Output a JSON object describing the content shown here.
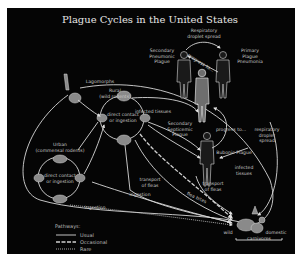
{
  "title": "Plague Cycles in the United States",
  "labels": {
    "respiratory_droplet_top": [
      "Respiratory",
      "droplet spread"
    ],
    "secondary_pneumonic": [
      "Secondary",
      "Pneumonic",
      "Plague"
    ],
    "primary_pneumonia": [
      "Primary",
      "Plague",
      "Pneumonia"
    ],
    "progress_to_top": "progress to...",
    "lagomorphs": "Lagomorphs",
    "rural": [
      "Rural",
      "(wild rodents)"
    ],
    "infected_tissues_top": "infected tissues",
    "secondary_septicemic": [
      "Secondary",
      "Septicemic",
      "Plague"
    ],
    "progress_to_mid": "progress to...",
    "respiratory_droplet_right": [
      "respiratory",
      "droplet",
      "spread"
    ],
    "urban": [
      "Urban",
      "(commensal rodents)"
    ],
    "direct_contact_rural": [
      "direct contact",
      "or ingestion"
    ],
    "direct_contact_urban": [
      "direct contact",
      "or ingestion"
    ],
    "bubonic_plague": "Bubonic Plague",
    "infected_tissues_right": [
      "infected",
      "tissues"
    ],
    "transport_fleas_left": [
      "transport",
      "of fleas"
    ],
    "transport_fleas_right": [
      "transport",
      "of fleas"
    ],
    "flea_bites": "flea bites",
    "ingestion_mid": "ingestion",
    "ingestion_bottom": "ingestion",
    "wild": "wild",
    "domestic": "domestic",
    "carnivores": "carnivores"
  },
  "legend": {
    "title": "Pathways:",
    "items": [
      {
        "style": "usual",
        "label": "Usual"
      },
      {
        "style": "occasional",
        "label": "Occasional"
      },
      {
        "style": "rare",
        "label": "Rare"
      }
    ]
  },
  "colors": {
    "background": "#050505",
    "page": "#ffffff",
    "line": "#d8d8d8",
    "text": "#c8c8c8"
  }
}
